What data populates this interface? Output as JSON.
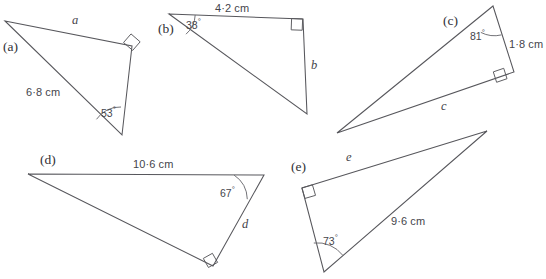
{
  "page": {
    "background": "#ffffff",
    "ink": "#57575c",
    "text_color": "#3b3b3b"
  },
  "figures": [
    {
      "id": "a",
      "part_label": "(a)",
      "part_label_pos": {
        "x": 3,
        "y": 40
      },
      "vertices": {
        "apex": [
          5,
          21
        ],
        "right_angle": [
          132,
          46
        ],
        "acute": [
          122,
          135
        ]
      },
      "unknown_side_label": "a",
      "unknown_side_pos": {
        "x": 72,
        "y": 14
      },
      "given_length": "6·8 cm",
      "given_length_pos": {
        "x": 26,
        "y": 87
      },
      "given_angle": "53",
      "given_angle_unit": "°",
      "given_angle_pos": {
        "x": 101,
        "y": 106
      },
      "right_angle_marker": true
    },
    {
      "id": "b",
      "part_label": "(b)",
      "part_label_pos": {
        "x": 158,
        "y": 22
      },
      "vertices": {
        "apex": [
          169,
          14
        ],
        "right_angle": [
          303,
          19
        ],
        "acute": [
          307,
          114
        ]
      },
      "unknown_side_label": "b",
      "unknown_side_pos": {
        "x": 311,
        "y": 59
      },
      "given_length": "4·2 cm",
      "given_length_pos": {
        "x": 215,
        "y": 3
      },
      "given_angle": "38",
      "given_angle_unit": "°",
      "given_angle_pos": {
        "x": 186,
        "y": 18
      },
      "right_angle_marker": true
    },
    {
      "id": "c",
      "part_label": "(c)",
      "part_label_pos": {
        "x": 443,
        "y": 14
      },
      "vertices": {
        "apex": [
          493,
          6
        ],
        "right_angle": [
          514,
          72
        ],
        "acute": [
          337,
          133
        ]
      },
      "unknown_side_label": "c",
      "unknown_side_pos": {
        "x": 441,
        "y": 100
      },
      "given_length": "1·8 cm",
      "given_length_pos": {
        "x": 509,
        "y": 39
      },
      "given_angle": "81",
      "given_angle_unit": "°",
      "given_angle_pos": {
        "x": 470,
        "y": 29
      },
      "right_angle_marker": true
    },
    {
      "id": "d",
      "part_label": "(d)",
      "part_label_pos": {
        "x": 40,
        "y": 153
      },
      "vertices": {
        "apex": [
          28,
          174
        ],
        "right_angle": [
          213,
          266
        ],
        "acute": [
          264,
          175
        ]
      },
      "unknown_side_label": "d",
      "unknown_side_pos": {
        "x": 242,
        "y": 218
      },
      "given_length": "10·6 cm",
      "given_length_pos": {
        "x": 133,
        "y": 159
      },
      "given_angle": "67",
      "given_angle_unit": "°",
      "given_angle_pos": {
        "x": 220,
        "y": 186
      },
      "right_angle_marker": true
    },
    {
      "id": "e",
      "part_label": "(e)",
      "part_label_pos": {
        "x": 291,
        "y": 160
      },
      "vertices": {
        "right_angle": [
          302,
          188
        ],
        "apex": [
          487,
          131
        ],
        "acute": [
          324,
          272
        ]
      },
      "unknown_side_label": "e",
      "unknown_side_pos": {
        "x": 346,
        "y": 151
      },
      "given_length": "9·6 cm",
      "given_length_pos": {
        "x": 391,
        "y": 216
      },
      "given_angle": "73",
      "given_angle_unit": "°",
      "given_angle_pos": {
        "x": 323,
        "y": 234
      },
      "right_angle_marker": true
    }
  ]
}
